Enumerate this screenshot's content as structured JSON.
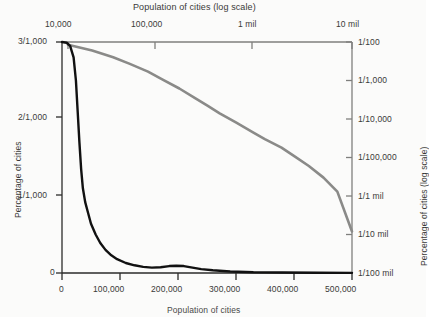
{
  "chart_data": {
    "type": "line",
    "title": "Population of cities (log scale)",
    "xlabel_bottom": "Population of cities",
    "ylabel_left": "Percentage of cities",
    "ylabel_right": "Percentage of cities (log scale)",
    "grid": false,
    "legend_position": "none",
    "axes": {
      "top": {
        "label": "Population of cities (log scale)",
        "scale": "log",
        "ticks": [
          "10,000",
          "100,000",
          "1 mil",
          "10 mil"
        ],
        "tick_values": [
          10000,
          100000,
          1000000,
          10000000
        ]
      },
      "bottom": {
        "label": "Population of cities",
        "scale": "linear",
        "ticks": [
          "0",
          "100,000",
          "200,000",
          "300,000",
          "400,000",
          "500,000"
        ],
        "tick_values": [
          0,
          100000,
          200000,
          300000,
          400000,
          500000
        ]
      },
      "left": {
        "label": "Percentage of cities",
        "scale": "linear",
        "ticks": [
          "3/1,000",
          "2/1,000",
          "1/1,000",
          "0"
        ],
        "tick_values": [
          0.003,
          0.002,
          0.001,
          0
        ]
      },
      "right": {
        "label": "Percentage of cities (log scale)",
        "scale": "log",
        "ticks": [
          "1/100",
          "1/1,000",
          "1/10,000",
          "1/100,000",
          "1/1 mil",
          "1/10 mil",
          "1/100 mil"
        ],
        "tick_values": [
          0.01,
          0.001,
          0.0001,
          1e-05,
          1e-06,
          1e-07,
          1e-08
        ]
      }
    },
    "series": [
      {
        "name": "linear-scale-curve",
        "color": "#111111",
        "axis": "linear (bottom / left)",
        "description": "Sharply decaying power-law curve on linear axes",
        "points_linear": [
          [
            0,
            0.003
          ],
          [
            8000,
            0.00299
          ],
          [
            14000,
            0.00295
          ],
          [
            20000,
            0.0028
          ],
          [
            24000,
            0.0025
          ],
          [
            27000,
            0.0021
          ],
          [
            30000,
            0.0017
          ],
          [
            33000,
            0.00135
          ],
          [
            36000,
            0.0011
          ],
          [
            40000,
            0.00092
          ],
          [
            45000,
            0.00078
          ],
          [
            50000,
            0.00064
          ],
          [
            58000,
            0.0005
          ],
          [
            66000,
            0.00039
          ],
          [
            75000,
            0.0003
          ],
          [
            85000,
            0.00023
          ],
          [
            95000,
            0.00018
          ],
          [
            110000,
            0.00013
          ],
          [
            125000,
            0.0001
          ],
          [
            140000,
            8e-05
          ],
          [
            155000,
            7e-05
          ],
          [
            170000,
            7.5e-05
          ],
          [
            185000,
            9e-05
          ],
          [
            197000,
            9.5e-05
          ],
          [
            210000,
            9e-05
          ],
          [
            225000,
            7e-05
          ],
          [
            240000,
            5e-05
          ],
          [
            260000,
            3.5e-05
          ],
          [
            290000,
            2e-05
          ],
          [
            330000,
            1e-05
          ],
          [
            380000,
            6e-06
          ],
          [
            440000,
            3e-06
          ],
          [
            500000,
            2e-06
          ]
        ]
      },
      {
        "name": "log-scale-curve",
        "color": "#8a8a88",
        "axis": "log (top / right)",
        "description": "Same distribution plotted on log-log axes, a near-straight declining line",
        "points_log": [
          [
            10000,
            0.0085
          ],
          [
            18000,
            0.006
          ],
          [
            30000,
            0.004
          ],
          [
            45000,
            0.0027
          ],
          [
            70000,
            0.0017
          ],
          [
            100000,
            0.00105
          ],
          [
            150000,
            0.00062
          ],
          [
            220000,
            0.00035
          ],
          [
            300000,
            0.00022
          ],
          [
            400000,
            0.00014
          ],
          [
            600000,
            8e-05
          ],
          [
            900000,
            4.5e-05
          ],
          [
            1200000,
            3e-05
          ],
          [
            1800000,
            1.8e-05
          ],
          [
            2500000,
            1.05e-05
          ],
          [
            3500000,
            6e-06
          ],
          [
            5000000,
            3e-06
          ],
          [
            7000000,
            1.3e-06
          ],
          [
            10000000,
            1.2e-07
          ]
        ]
      }
    ]
  },
  "geometry": {
    "plot_left": 62,
    "plot_right": 352,
    "plot_top": 42,
    "plot_bottom": 273
  }
}
